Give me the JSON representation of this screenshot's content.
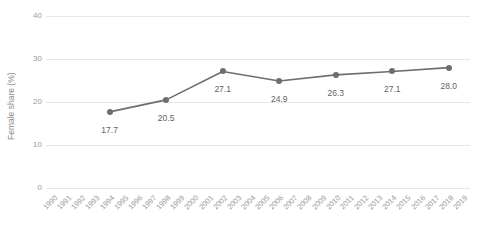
{
  "chart_data": {
    "type": "line",
    "title": "",
    "xlabel": "",
    "ylabel": "Female share (%)",
    "ylim": [
      0,
      40
    ],
    "yticks": [
      0,
      10,
      20,
      30,
      40
    ],
    "ytick_labels": [
      "0",
      "10",
      "20",
      "30",
      "40"
    ],
    "xlim": [
      1990,
      2019
    ],
    "grid": "horizontal",
    "legend": "none",
    "line_color": "#6e6e6e",
    "marker_color": "#6e6e6e",
    "gridline_color": "#e8e8e8",
    "tick_label_color": "#9a9a9a",
    "data_label_color": "#5f5f5f",
    "background": "#ffffff",
    "xtick_labels": [
      "1990",
      "1991",
      "1992",
      "1993",
      "1994",
      "1995",
      "1996",
      "1997",
      "1998",
      "1999",
      "2000",
      "2001",
      "2002",
      "2003",
      "2004",
      "2005",
      "2006",
      "2007",
      "2008",
      "2009",
      "2010",
      "2011",
      "2012",
      "2013",
      "2014",
      "2015",
      "2016",
      "2017",
      "2018",
      "2019"
    ],
    "x": [
      1994,
      1998,
      2002,
      2006,
      2010,
      2014,
      2018
    ],
    "values": [
      17.7,
      20.5,
      27.1,
      24.9,
      26.3,
      27.1,
      28.0
    ],
    "data_labels": [
      "17.7",
      "20.5",
      "27.1",
      "24.9",
      "26.3",
      "27.1",
      "28.0"
    ]
  }
}
